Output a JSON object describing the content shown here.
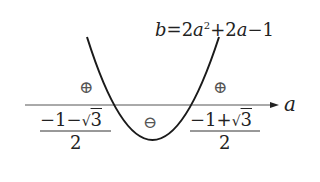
{
  "diagram": {
    "equation": {
      "lhs_var": "b",
      "equals": "=",
      "coef1": "2",
      "var1": "a",
      "exp1": "2",
      "plus": "+",
      "coef2": "2",
      "var2": "a",
      "minus": "−",
      "const": "1"
    },
    "axis": {
      "label": "a"
    },
    "roots": {
      "left": {
        "numerator_a": "−1−",
        "radical": "√",
        "radicand": "3",
        "denominator": "2"
      },
      "right": {
        "numerator_a": "−1+",
        "radical": "√",
        "radicand": "3",
        "denominator": "2"
      }
    },
    "signs": {
      "left": "⊕",
      "middle": "⊖",
      "right": "⊕"
    },
    "colors": {
      "curve": "#1a1a1a",
      "axis": "#555555",
      "text": "#222222",
      "sign": "#555555"
    }
  }
}
